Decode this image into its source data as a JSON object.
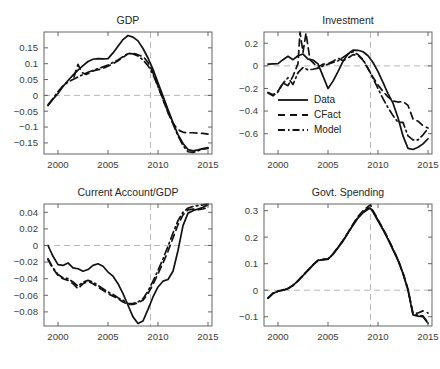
{
  "figure": {
    "title": "",
    "caption": "",
    "background": "#ffffff",
    "line_color": "#111111",
    "reference_line_color": "#b9b9b9",
    "axis_color": "#555555"
  },
  "legend": {
    "position": "investment-panel-lower-left",
    "entries": [
      {
        "label": "Data",
        "style": "solid"
      },
      {
        "label": "CFact",
        "style": "dashed"
      },
      {
        "label": "Model",
        "style": "dashdot"
      }
    ]
  },
  "chart_data": [
    {
      "id": "gdp",
      "type": "line",
      "title": "GDP",
      "xlabel": "",
      "ylabel": "",
      "xlim": [
        1998.6,
        2015.4
      ],
      "ylim": [
        -0.185,
        0.2
      ],
      "xticks": [
        2000,
        2005,
        2010,
        2015
      ],
      "yticks": [
        0.15,
        0.1,
        0.05,
        0,
        -0.05,
        -0.1,
        -0.15
      ],
      "ytick_labels": [
        "0.15",
        "0.1",
        "0.05",
        "0",
        "−0.05",
        "−0.1",
        "−0.15"
      ],
      "xtick_labels": [
        "2000",
        "2005",
        "2010",
        "2015"
      ],
      "grid": false,
      "hline": 0,
      "vline": 2009.25,
      "x": [
        1999,
        1999.5,
        2000,
        2000.5,
        2001,
        2001.5,
        2002,
        2002.5,
        2003,
        2003.5,
        2004,
        2004.5,
        2005,
        2005.5,
        2006,
        2006.5,
        2007,
        2007.5,
        2008,
        2008.5,
        2009,
        2009.5,
        2010,
        2010.5,
        2011,
        2011.5,
        2012,
        2012.5,
        2013,
        2013.5,
        2014,
        2014.5,
        2015
      ],
      "series": [
        {
          "name": "Data",
          "style": "solid",
          "values": [
            -0.032,
            -0.012,
            0.006,
            0.028,
            0.047,
            0.064,
            0.08,
            0.094,
            0.107,
            0.114,
            0.116,
            0.115,
            0.116,
            0.134,
            0.155,
            0.176,
            0.189,
            0.184,
            0.172,
            0.148,
            0.118,
            0.082,
            0.04,
            -0.002,
            -0.045,
            -0.086,
            -0.124,
            -0.152,
            -0.171,
            -0.175,
            -0.172,
            -0.168,
            -0.165
          ]
        },
        {
          "name": "CFact",
          "style": "dashed",
          "x": [
            2001.6,
            2002.0,
            2002.4,
            2002.8,
            2003.2,
            2003.6,
            2004.0,
            2004.5,
            2005.0,
            2005.5,
            2006.0,
            2006.5,
            2007.0,
            2007.4,
            2007.8,
            2008.2,
            2008.6,
            2009.0,
            2009.4,
            2009.8,
            2010.2,
            2010.6,
            2011.0,
            2011.4,
            2011.8,
            2012.2,
            2012.6,
            2013.0,
            2013.5,
            2014.0,
            2014.5,
            2015.0
          ],
          "values": [
            0.058,
            0.098,
            0.072,
            0.066,
            0.072,
            0.078,
            0.081,
            0.085,
            0.092,
            0.1,
            0.109,
            0.12,
            0.131,
            0.134,
            0.13,
            0.126,
            0.12,
            0.104,
            0.079,
            0.046,
            0.012,
            -0.022,
            -0.055,
            -0.082,
            -0.101,
            -0.112,
            -0.117,
            -0.118,
            -0.118,
            -0.119,
            -0.12,
            -0.122
          ]
        },
        {
          "name": "Model",
          "style": "dashdot",
          "x": [
            1999,
            1999.5,
            2000,
            2000.5,
            2001,
            2001.5,
            2002,
            2002.5,
            2003,
            2003.5,
            2004,
            2004.5,
            2005,
            2005.5,
            2006,
            2006.5,
            2007,
            2007.5,
            2008,
            2008.5,
            2009,
            2009.5,
            2010,
            2010.5,
            2011,
            2011.5,
            2012,
            2012.5,
            2013,
            2013.5,
            2014,
            2014.5,
            2015
          ],
          "values": [
            -0.03,
            -0.01,
            0.012,
            0.03,
            0.042,
            0.05,
            0.058,
            0.066,
            0.073,
            0.079,
            0.084,
            0.09,
            0.096,
            0.104,
            0.112,
            0.122,
            0.132,
            0.131,
            0.124,
            0.112,
            0.094,
            0.066,
            0.028,
            -0.012,
            -0.052,
            -0.09,
            -0.128,
            -0.158,
            -0.178,
            -0.18,
            -0.175,
            -0.17,
            -0.167
          ]
        }
      ]
    },
    {
      "id": "investment",
      "type": "line",
      "title": "Investment",
      "xlabel": "",
      "ylabel": "",
      "xlim": [
        1998.6,
        2015.4
      ],
      "ylim": [
        -0.78,
        0.3
      ],
      "xticks": [
        2000,
        2005,
        2010,
        2015
      ],
      "yticks": [
        0.2,
        0,
        -0.2,
        -0.4,
        -0.6
      ],
      "ytick_labels": [
        "0.2",
        "0",
        "−0.2",
        "−0.4",
        "−0.6"
      ],
      "xtick_labels": [
        "2000",
        "2005",
        "2010",
        "2015"
      ],
      "grid": false,
      "hline": 0,
      "vline": 2009.25,
      "x": [
        1999,
        1999.5,
        2000,
        2000.5,
        2001,
        2001.5,
        2002,
        2002.5,
        2003,
        2003.5,
        2004,
        2004.5,
        2005,
        2005.5,
        2006,
        2006.5,
        2007,
        2007.5,
        2008,
        2008.5,
        2009,
        2009.5,
        2010,
        2010.5,
        2011,
        2011.5,
        2012,
        2012.5,
        2013,
        2013.5,
        2014,
        2014.5,
        2015
      ],
      "series": [
        {
          "name": "Data",
          "style": "solid",
          "values": [
            0.015,
            0.018,
            0.02,
            0.055,
            0.085,
            0.055,
            0.09,
            0.105,
            0.06,
            0.052,
            0.018,
            -0.09,
            -0.2,
            -0.135,
            -0.05,
            0.04,
            0.105,
            0.14,
            0.138,
            0.125,
            0.09,
            0.03,
            -0.05,
            -0.145,
            -0.245,
            -0.33,
            -0.46,
            -0.62,
            -0.73,
            -0.74,
            -0.72,
            -0.69,
            -0.645
          ]
        },
        {
          "name": "CFact",
          "style": "dashed",
          "x": [
            1999,
            1999.5,
            2000,
            2000.5,
            2001,
            2001.5,
            2002,
            2002.2,
            2002.5,
            2002.8,
            2003.2,
            2003.6,
            2004.0,
            2004.5,
            2005.0,
            2005.5,
            2006.0,
            2006.5,
            2007.0,
            2007.5,
            2008.0,
            2008.5,
            2009.0,
            2009.5,
            2010.0,
            2010.5,
            2011.0,
            2011.5,
            2012.0,
            2012.5,
            2013.0,
            2013.5,
            2014.0,
            2014.5,
            2015.0
          ],
          "values": [
            -0.235,
            -0.255,
            -0.225,
            -0.15,
            -0.175,
            -0.09,
            0.02,
            0.3,
            0.12,
            0.29,
            0.055,
            0.02,
            -0.01,
            0.015,
            0.02,
            0.04,
            0.07,
            0.045,
            0.07,
            0.1,
            0.095,
            0.05,
            -0.025,
            -0.1,
            -0.17,
            -0.225,
            -0.275,
            -0.31,
            -0.32,
            -0.315,
            -0.35,
            -0.47,
            -0.49,
            -0.53,
            -0.55
          ]
        },
        {
          "name": "Model",
          "style": "dashdot",
          "x": [
            1999,
            1999.5,
            2000,
            2000.5,
            2001,
            2001.5,
            2002,
            2002.5,
            2003,
            2003.5,
            2004,
            2004.5,
            2005,
            2005.5,
            2006,
            2006.5,
            2007,
            2007.5,
            2008,
            2008.5,
            2009,
            2009.5,
            2010,
            2010.5,
            2011,
            2011.5,
            2012,
            2012.5,
            2013,
            2013.5,
            2014,
            2014.5,
            2015
          ],
          "values": [
            -0.24,
            -0.265,
            -0.23,
            -0.155,
            -0.105,
            -0.165,
            -0.06,
            -0.015,
            -0.035,
            -0.03,
            -0.02,
            0.0,
            0.015,
            0.03,
            0.045,
            0.075,
            0.105,
            0.125,
            0.1,
            0.055,
            -0.02,
            -0.11,
            -0.2,
            -0.29,
            -0.37,
            -0.44,
            -0.5,
            -0.5,
            -0.62,
            -0.655,
            -0.655,
            -0.61,
            -0.555
          ]
        }
      ]
    },
    {
      "id": "current-account-gdp",
      "type": "line",
      "title": "Current Account/GDP",
      "xlabel": "",
      "ylabel": "",
      "xlim": [
        1998.6,
        2015.4
      ],
      "ylim": [
        -0.097,
        0.05
      ],
      "xticks": [
        2000,
        2005,
        2010,
        2015
      ],
      "yticks": [
        0.04,
        0.02,
        0,
        -0.02,
        -0.04,
        -0.06,
        -0.08
      ],
      "ytick_labels": [
        "0.04",
        "0.02",
        "0",
        "−0.02",
        "−0.04",
        "−0.06",
        "−0.08"
      ],
      "xtick_labels": [
        "2000",
        "2005",
        "2010",
        "2015"
      ],
      "grid": false,
      "hline": 0,
      "vline": 2009.25,
      "x": [
        1999,
        1999.5,
        2000,
        2000.5,
        2001,
        2001.5,
        2002,
        2002.5,
        2003,
        2003.5,
        2004,
        2004.5,
        2005,
        2005.5,
        2006,
        2006.5,
        2007,
        2007.5,
        2008,
        2008.5,
        2009,
        2009.5,
        2010,
        2010.5,
        2011,
        2011.5,
        2012,
        2012.5,
        2013,
        2013.5,
        2014,
        2014.5,
        2015
      ],
      "series": [
        {
          "name": "Data",
          "style": "solid",
          "values": [
            0.0,
            -0.013,
            -0.023,
            -0.024,
            -0.021,
            -0.027,
            -0.028,
            -0.031,
            -0.029,
            -0.024,
            -0.022,
            -0.025,
            -0.032,
            -0.037,
            -0.046,
            -0.058,
            -0.072,
            -0.086,
            -0.094,
            -0.091,
            -0.077,
            -0.062,
            -0.05,
            -0.043,
            -0.041,
            -0.031,
            -0.006,
            0.024,
            0.039,
            0.042,
            0.044,
            0.046,
            0.049
          ]
        },
        {
          "name": "CFact",
          "style": "dashed",
          "x": [
            1999,
            1999.5,
            2000,
            2000.5,
            2001,
            2001.5,
            2002,
            2002.5,
            2003,
            2003.5,
            2004,
            2004.5,
            2005,
            2005.5,
            2006,
            2006.5,
            2007,
            2007.5,
            2008,
            2008.5,
            2009,
            2009.5,
            2010,
            2010.5,
            2011,
            2011.5,
            2012,
            2012.5,
            2013,
            2013.5,
            2014,
            2014.5,
            2015
          ],
          "values": [
            -0.017,
            -0.028,
            -0.036,
            -0.04,
            -0.042,
            -0.046,
            -0.052,
            -0.046,
            -0.043,
            -0.046,
            -0.05,
            -0.054,
            -0.058,
            -0.061,
            -0.064,
            -0.068,
            -0.071,
            -0.071,
            -0.069,
            -0.066,
            -0.058,
            -0.047,
            -0.034,
            -0.021,
            -0.007,
            0.009,
            0.025,
            0.037,
            0.043,
            0.044,
            0.043,
            0.044,
            0.046
          ]
        },
        {
          "name": "Model",
          "style": "dashdot",
          "x": [
            1999,
            1999.5,
            2000,
            2000.5,
            2001,
            2001.5,
            2002,
            2002.5,
            2003,
            2003.5,
            2004,
            2004.5,
            2005,
            2005.5,
            2006,
            2006.5,
            2007,
            2007.5,
            2008,
            2008.5,
            2009,
            2009.5,
            2010,
            2010.5,
            2011,
            2011.5,
            2012,
            2012.5,
            2013,
            2013.5,
            2014,
            2014.5,
            2015
          ],
          "values": [
            -0.016,
            -0.027,
            -0.035,
            -0.039,
            -0.04,
            -0.044,
            -0.049,
            -0.044,
            -0.042,
            -0.044,
            -0.048,
            -0.052,
            -0.056,
            -0.059,
            -0.063,
            -0.066,
            -0.07,
            -0.07,
            -0.068,
            -0.064,
            -0.055,
            -0.043,
            -0.03,
            -0.016,
            -0.001,
            0.015,
            0.03,
            0.04,
            0.045,
            0.047,
            0.048,
            0.049,
            0.05
          ]
        }
      ]
    },
    {
      "id": "govt-spending",
      "type": "line",
      "title": "Govt. Spending",
      "xlabel": "",
      "ylabel": "",
      "xlim": [
        1998.6,
        2015.4
      ],
      "ylim": [
        -0.135,
        0.325
      ],
      "xticks": [
        2000,
        2005,
        2010,
        2015
      ],
      "yticks": [
        0.3,
        0.2,
        0.1,
        0,
        -0.1
      ],
      "ytick_labels": [
        "0.3",
        "0.2",
        "0.1",
        "0",
        "−0.1"
      ],
      "xtick_labels": [
        "2000",
        "2005",
        "2010",
        "2015"
      ],
      "grid": false,
      "hline": 0,
      "vline": 2009.25,
      "x": [
        1999,
        1999.5,
        2000,
        2000.5,
        2001,
        2001.5,
        2002,
        2002.5,
        2003,
        2003.5,
        2004,
        2004.5,
        2005,
        2005.5,
        2006,
        2006.5,
        2007,
        2007.5,
        2008,
        2008.5,
        2009,
        2009.25,
        2009.5,
        2010,
        2010.5,
        2011,
        2011.5,
        2012,
        2012.5,
        2013,
        2013.5,
        2014,
        2014.5,
        2015
      ],
      "series": [
        {
          "name": "Data",
          "style": "solid",
          "values": [
            -0.03,
            -0.012,
            -0.004,
            0.0,
            0.006,
            0.018,
            0.035,
            0.055,
            0.075,
            0.095,
            0.112,
            0.115,
            0.117,
            0.135,
            0.16,
            0.185,
            0.215,
            0.245,
            0.272,
            0.292,
            0.305,
            0.308,
            0.295,
            0.262,
            0.228,
            0.192,
            0.152,
            0.112,
            0.062,
            0.0,
            -0.093,
            -0.098,
            -0.1,
            -0.125
          ]
        },
        {
          "name": "CFact",
          "style": "dashed",
          "x": [
            1999,
            1999.5,
            2000,
            2000.5,
            2001,
            2001.5,
            2002,
            2002.5,
            2003,
            2003.5,
            2004,
            2004.5,
            2005,
            2005.5,
            2006,
            2006.5,
            2007,
            2007.5,
            2008,
            2008.5,
            2009,
            2009.25,
            2009.5,
            2010,
            2010.5,
            2011,
            2011.5,
            2012,
            2012.5,
            2013,
            2013.5,
            2014,
            2014.5,
            2015
          ],
          "values": [
            -0.03,
            -0.012,
            -0.004,
            0.001,
            0.007,
            0.019,
            0.036,
            0.056,
            0.076,
            0.096,
            0.113,
            0.116,
            0.118,
            0.137,
            0.162,
            0.188,
            0.218,
            0.249,
            0.278,
            0.3,
            0.315,
            0.322,
            0.3,
            0.266,
            0.232,
            0.196,
            0.156,
            0.116,
            0.066,
            0.004,
            -0.088,
            -0.086,
            -0.078,
            -0.086
          ]
        },
        {
          "name": "Model",
          "style": "dashdot",
          "x": [
            1999,
            1999.5,
            2000,
            2000.5,
            2001,
            2001.5,
            2002,
            2002.5,
            2003,
            2003.5,
            2004,
            2004.5,
            2005,
            2005.5,
            2006,
            2006.5,
            2007,
            2007.5,
            2008,
            2008.5,
            2009,
            2009.25,
            2009.5,
            2010,
            2010.5,
            2011,
            2011.5,
            2012,
            2012.5,
            2013,
            2013.5,
            2014,
            2014.5,
            2015
          ],
          "values": [
            -0.03,
            -0.012,
            -0.004,
            0.0,
            0.006,
            0.018,
            0.035,
            0.055,
            0.075,
            0.095,
            0.112,
            0.115,
            0.117,
            0.136,
            0.161,
            0.186,
            0.216,
            0.247,
            0.275,
            0.295,
            0.309,
            0.312,
            0.297,
            0.264,
            0.23,
            0.194,
            0.154,
            0.114,
            0.064,
            0.002,
            -0.09,
            -0.094,
            -0.097,
            -0.122
          ]
        }
      ]
    }
  ]
}
